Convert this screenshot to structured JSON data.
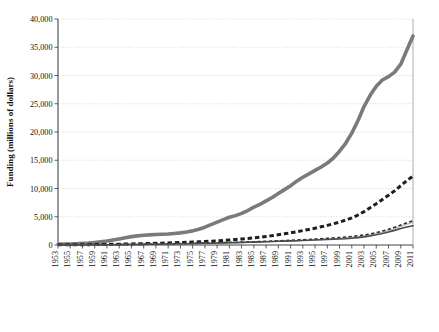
{
  "chart_data": {
    "type": "line",
    "title": "",
    "xlabel": "",
    "ylabel": "Funding (millions of dollars)",
    "ylim": [
      0,
      40000
    ],
    "xlim": [
      1953,
      2011
    ],
    "ytick_step": 5000,
    "ytick_labels": [
      "0",
      "5,000",
      "10,000",
      "15,000",
      "20,000",
      "25,000",
      "30,000",
      "35,000",
      "40,000"
    ],
    "ytick_values": [
      0,
      5000,
      10000,
      15000,
      20000,
      25000,
      30000,
      35000,
      40000
    ],
    "grid": true,
    "grid_style": "dotted-horizontal",
    "legend_position": "bottom",
    "legend_columns": 2,
    "xtick_labels": [
      "1953",
      "1955",
      "1957",
      "1959",
      "1961",
      "1963",
      "1965",
      "1967",
      "1969",
      "1971",
      "1973",
      "1975",
      "1977",
      "1979",
      "1981",
      "1983",
      "1985",
      "1987",
      "1989",
      "1991",
      "1993",
      "1995",
      "1997",
      "1999",
      "2001",
      "2003",
      "2005",
      "2007",
      "2009",
      "2011"
    ],
    "xtick_values": [
      1953,
      1955,
      1957,
      1959,
      1961,
      1963,
      1965,
      1967,
      1969,
      1971,
      1973,
      1975,
      1977,
      1979,
      1981,
      1983,
      1985,
      1987,
      1989,
      1991,
      1993,
      1995,
      1997,
      1999,
      2001,
      2003,
      2005,
      2007,
      2009,
      2011
    ],
    "xtick_rotation": 90,
    "x": [
      1953,
      1954,
      1955,
      1956,
      1957,
      1958,
      1959,
      1960,
      1961,
      1962,
      1963,
      1964,
      1965,
      1966,
      1967,
      1968,
      1969,
      1970,
      1971,
      1972,
      1973,
      1974,
      1975,
      1976,
      1977,
      1978,
      1979,
      1980,
      1981,
      1982,
      1983,
      1984,
      1985,
      1986,
      1987,
      1988,
      1989,
      1990,
      1991,
      1992,
      1993,
      1994,
      1995,
      1996,
      1997,
      1998,
      1999,
      2000,
      2001,
      2002,
      2003,
      2004,
      2005,
      2006,
      2007,
      2008,
      2009,
      2010,
      2011
    ],
    "series": [
      {
        "name": "Federal government",
        "color": "#7a7a7a",
        "style": "solid",
        "width": 3.6,
        "values": [
          140,
          160,
          190,
          230,
          280,
          340,
          440,
          560,
          700,
          880,
          1080,
          1300,
          1480,
          1620,
          1730,
          1800,
          1850,
          1900,
          1960,
          2050,
          2150,
          2300,
          2500,
          2800,
          3150,
          3600,
          4050,
          4500,
          4900,
          5200,
          5600,
          6100,
          6700,
          7200,
          7800,
          8400,
          9100,
          9800,
          10500,
          11300,
          12000,
          12600,
          13200,
          13800,
          14500,
          15400,
          16600,
          18000,
          19800,
          22000,
          24500,
          26500,
          28100,
          29200,
          29800,
          30600,
          32000,
          34500,
          37000
        ]
      },
      {
        "name": "Institution funds",
        "color": "#1f1f1f",
        "style": "dashed-thick",
        "width": 3.0,
        "values": [
          30,
          35,
          40,
          48,
          56,
          66,
          78,
          92,
          108,
          126,
          146,
          168,
          192,
          218,
          245,
          272,
          300,
          330,
          360,
          395,
          430,
          470,
          515,
          565,
          620,
          680,
          745,
          815,
          890,
          970,
          1060,
          1160,
          1270,
          1390,
          1520,
          1660,
          1810,
          1980,
          2160,
          2350,
          2550,
          2760,
          2980,
          3220,
          3480,
          3760,
          4060,
          4400,
          4800,
          5300,
          5900,
          6600,
          7300,
          8050,
          8800,
          9600,
          10500,
          11400,
          12200
        ]
      },
      {
        "name": "State and local government",
        "color": "#b5b5b5",
        "style": "solid-thin",
        "width": 1.3,
        "values": [
          20,
          23,
          26,
          30,
          34,
          39,
          45,
          52,
          60,
          69,
          79,
          90,
          102,
          114,
          127,
          140,
          154,
          168,
          183,
          198,
          214,
          231,
          249,
          268,
          288,
          309,
          331,
          354,
          378,
          403,
          430,
          458,
          488,
          520,
          554,
          590,
          628,
          668,
          710,
          755,
          802,
          852,
          905,
          960,
          1020,
          1085,
          1155,
          1235,
          1330,
          1450,
          1600,
          1790,
          2010,
          2270,
          2560,
          2900,
          3300,
          3700,
          4000
        ]
      },
      {
        "name": "All other sources",
        "color": "#2b2b2b",
        "style": "dashed-thin",
        "width": 1.5,
        "values": [
          25,
          28,
          32,
          37,
          42,
          48,
          55,
          63,
          72,
          82,
          93,
          105,
          118,
          132,
          147,
          163,
          180,
          198,
          217,
          237,
          258,
          280,
          303,
          327,
          352,
          378,
          405,
          433,
          462,
          492,
          523,
          556,
          590,
          626,
          664,
          704,
          746,
          790,
          837,
          886,
          938,
          993,
          1051,
          1113,
          1179,
          1250,
          1327,
          1412,
          1510,
          1630,
          1780,
          1970,
          2200,
          2470,
          2780,
          3130,
          3530,
          3950,
          4300
        ]
      },
      {
        "name": "Business",
        "color": "#4a4a4a",
        "style": "solid",
        "width": 1.6,
        "values": [
          15,
          17,
          20,
          23,
          27,
          31,
          36,
          42,
          49,
          57,
          66,
          76,
          87,
          99,
          112,
          126,
          141,
          157,
          174,
          192,
          211,
          231,
          252,
          274,
          297,
          321,
          346,
          372,
          399,
          427,
          456,
          486,
          517,
          549,
          582,
          616,
          651,
          687,
          724,
          762,
          801,
          841,
          882,
          924,
          967,
          1011,
          1056,
          1110,
          1190,
          1300,
          1440,
          1610,
          1810,
          2040,
          2300,
          2590,
          2920,
          3180,
          3400
        ]
      }
    ]
  },
  "legend": {
    "items": [
      {
        "label": "Federal government",
        "swatch": "thick-gray-solid"
      },
      {
        "label": "Institution funds",
        "swatch": "thick-dark-dashed"
      },
      {
        "label": "State and local government",
        "swatch": "thin-lightgray-solid"
      },
      {
        "label": "All other sources",
        "swatch": "thin-dark-dashed"
      },
      {
        "label": "Business",
        "swatch": "medium-dark-solid"
      }
    ]
  }
}
